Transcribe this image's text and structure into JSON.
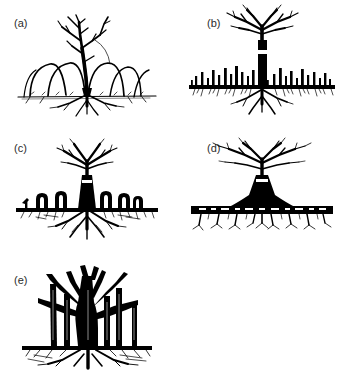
{
  "figure": {
    "background_color": "#ffffff",
    "ink_color": "#000000",
    "label_color": "#2b2b2b",
    "panel_count": 5,
    "layout": "2 columns x 2 rows, plus one panel on a third row at left"
  },
  "panels": [
    {
      "id": "a",
      "label": "(a)",
      "caption": "Tree with arching layering branches that bend to the ground and root",
      "features": [
        "slender leaning stem",
        "sparse forked crown",
        "arched ground-layering branches",
        "shallow surface root mat"
      ],
      "arch_count": 5,
      "root_style": "shallow-fibrous"
    },
    {
      "id": "b",
      "label": "(b)",
      "caption": "Tree with a straight bole and a field of erect root suckers along a horizontal lateral root",
      "features": [
        "straight solid trunk",
        "umbrella-like forked crown",
        "horizontal lateral root line",
        "numerous vertical root suckers"
      ],
      "sucker_count": 24,
      "root_style": "horizontal-lateral-with-suckers"
    },
    {
      "id": "c",
      "label": "(c)",
      "caption": "Tree with looping knee roots arching above the soil surface",
      "features": [
        "tapered flared trunk",
        "spreading forked crown",
        "knee-root loops above ground line",
        "descending sinker roots"
      ],
      "knee_count": 6,
      "root_style": "knee-roots"
    },
    {
      "id": "d",
      "label": "(d)",
      "caption": "Tree with a buttressed conical trunk base and a broad shallow plate root",
      "features": [
        "broad wide-spreading crown",
        "conical buttressed trunk base",
        "thick horizontal plate root",
        "short descending rootlets"
      ],
      "rootlet_count": 9,
      "root_style": "plate-root"
    },
    {
      "id": "e",
      "label": "(e)",
      "caption": "Banyan-like tree with multiple descending aerial prop roots forming pillars",
      "features": [
        "massive branching trunk",
        "pendant aerial prop roots",
        "pillar roots reaching ground",
        "spreading surface roots"
      ],
      "prop_root_count": 6,
      "root_style": "aerial-prop-roots"
    }
  ]
}
